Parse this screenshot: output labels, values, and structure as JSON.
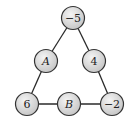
{
  "diagram": {
    "type": "magic-triangle",
    "colors": {
      "edge": "#2a2a2a",
      "node_fill_light": "#f2f2f2",
      "node_fill_dark": "#c8c8c8",
      "node_stroke": "#333333",
      "text": "#222222"
    },
    "nodes": [
      {
        "id": "top",
        "label": "−5",
        "x": 73,
        "y": 18,
        "italic": false
      },
      {
        "id": "A",
        "label": "A",
        "x": 46,
        "y": 61,
        "italic": true
      },
      {
        "id": "right-mid",
        "label": "4",
        "x": 94,
        "y": 61,
        "italic": false
      },
      {
        "id": "bottom-left",
        "label": "6",
        "x": 27,
        "y": 104,
        "italic": false
      },
      {
        "id": "B",
        "label": "B",
        "x": 69,
        "y": 104,
        "italic": true
      },
      {
        "id": "bottom-right",
        "label": "−2",
        "x": 112,
        "y": 104,
        "italic": false
      }
    ],
    "edges": [
      [
        "top",
        "A"
      ],
      [
        "A",
        "bottom-left"
      ],
      [
        "top",
        "right-mid"
      ],
      [
        "right-mid",
        "bottom-right"
      ],
      [
        "bottom-left",
        "B"
      ],
      [
        "B",
        "bottom-right"
      ]
    ]
  }
}
